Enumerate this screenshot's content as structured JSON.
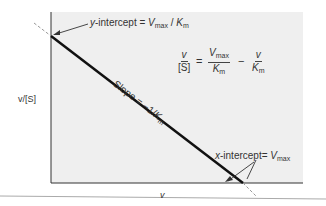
{
  "diagram": {
    "y_axis_label": "v/[S]",
    "x_axis_label": "v",
    "y_intercept": {
      "prefix": "y",
      "text": "-intercept = ",
      "var": "V",
      "sub": "max",
      "sep": " / ",
      "var2": "K",
      "sub2": "m"
    },
    "x_intercept": {
      "prefix": "x",
      "text": "-intercept= ",
      "var": "V",
      "sub": "max"
    },
    "slope": {
      "text": "Slope = −1/",
      "var": "K",
      "sub": "m"
    },
    "equation": {
      "lhs_num": "v",
      "lhs_den": "[S]",
      "equals": "=",
      "t1_num_var": "V",
      "t1_num_sub": "max",
      "t1_den_var": "K",
      "t1_den_sub": "m",
      "minus": "−",
      "t2_num": "v",
      "t2_den_var": "K",
      "t2_den_sub": "m"
    },
    "colors": {
      "plot_bg": "#efefef",
      "line": "#111111",
      "axis": "#333333",
      "dash": "#999999"
    }
  }
}
